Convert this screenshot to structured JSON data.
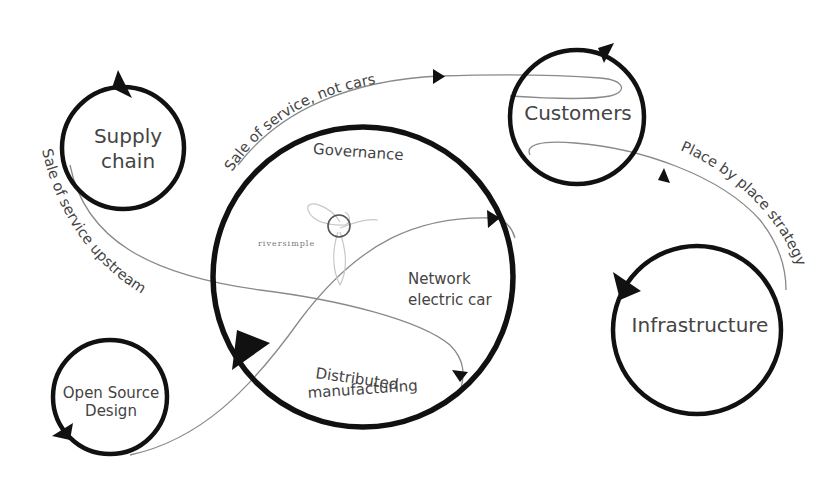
{
  "diagram": {
    "nodes": {
      "supply_chain": {
        "line1": "Supply",
        "line2": "chain"
      },
      "customers": {
        "label": "Customers"
      },
      "infrastructure": {
        "label": "Infrastructure"
      },
      "open_source_design": {
        "line1": "Open Source",
        "line2": "Design"
      },
      "main": {
        "governance": "Governance",
        "network_line1": "Network",
        "network_line2": "electric car",
        "distributed_line1": "Distributed",
        "distributed_line2": "manufacturing"
      }
    },
    "flows": {
      "sale_not_cars": "Sale of service, not cars",
      "sale_upstream": "Sale of service upstream",
      "place_by_place": "Place by place strategy"
    },
    "logo": {
      "text": "riversimple"
    },
    "colors": {
      "ring": "#111111",
      "flow": "#8a8a8a",
      "text": "#444444",
      "background": "#ffffff"
    }
  }
}
